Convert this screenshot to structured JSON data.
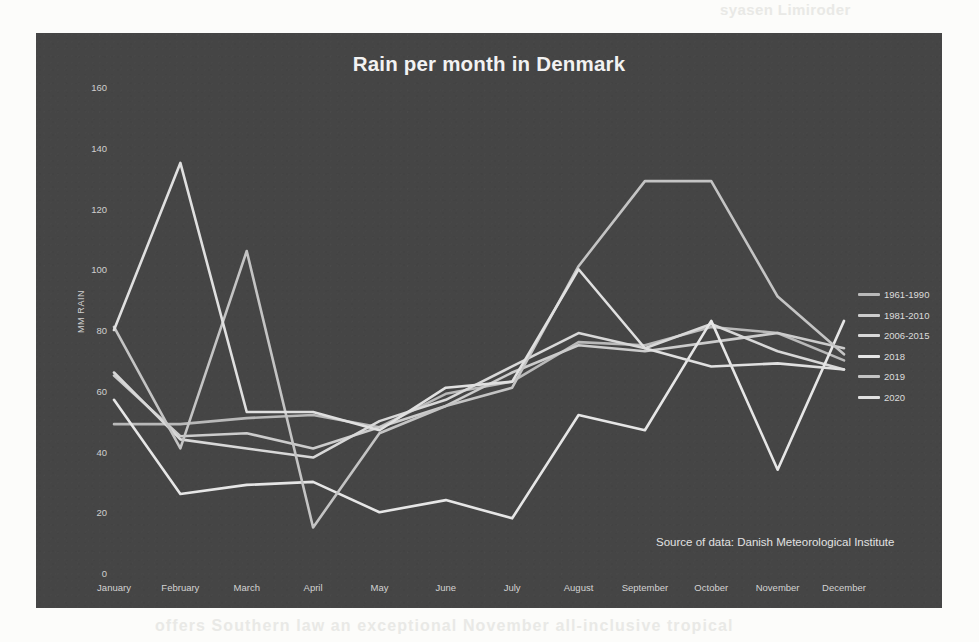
{
  "page": {
    "showthrough_top": "syasen Limiroder",
    "showthrough_bottom": "offers Southern law an exceptional November all-inclusive tropical"
  },
  "chart": {
    "title": "Rain per month in Denmark",
    "source_note": "Source of data: Danish Meteorological Institute",
    "panel_color": "#454545",
    "text_color": "#e6e6e6"
  },
  "chart_data": {
    "type": "line",
    "title": "Rain per month in Denmark",
    "xlabel": "",
    "ylabel": "MM RAIN",
    "ylim": [
      0,
      160
    ],
    "yticks": [
      0,
      20,
      40,
      60,
      80,
      100,
      120,
      140,
      160
    ],
    "grid": false,
    "legend_position": "right",
    "annotation": "Source of data: Danish Meteorological Institute",
    "categories": [
      "January",
      "February",
      "March",
      "April",
      "May",
      "June",
      "July",
      "August",
      "September",
      "October",
      "November",
      "December"
    ],
    "series": [
      {
        "name": "1961-1990",
        "color": "#b9b9b9",
        "values": [
          49,
          49,
          51,
          52,
          48,
          59,
          63,
          76,
          75,
          81,
          79,
          70
        ]
      },
      {
        "name": "1981-2010",
        "color": "#cccccc",
        "values": [
          65,
          45,
          46,
          41,
          48,
          55,
          66,
          75,
          73,
          76,
          79,
          74
        ]
      },
      {
        "name": "2006-2015",
        "color": "#d8d8d8",
        "values": [
          66,
          44,
          41,
          38,
          50,
          57,
          68,
          79,
          74,
          82,
          73,
          67
        ]
      },
      {
        "name": "2018",
        "color": "#e6e6e6",
        "values": [
          57,
          26,
          29,
          30,
          20,
          24,
          18,
          52,
          47,
          83,
          34,
          83
        ]
      },
      {
        "name": "2019",
        "color": "#c4c4c4",
        "values": [
          81,
          41,
          106,
          15,
          46,
          55,
          61,
          101,
          129,
          129,
          91,
          72
        ]
      },
      {
        "name": "2020",
        "color": "#e0e0e0",
        "values": [
          80,
          135,
          53,
          53,
          47,
          61,
          63,
          100,
          74,
          68,
          69,
          67
        ]
      }
    ]
  }
}
